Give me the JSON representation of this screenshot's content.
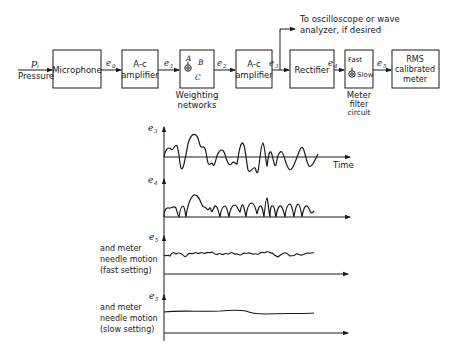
{
  "block_diagram": {
    "input": {
      "symbol": "p",
      "subscript": "i",
      "label": "Pressure"
    },
    "blocks": [
      {
        "id": "microphone",
        "label": [
          "Microphone"
        ]
      },
      {
        "id": "ac-amplifier-1",
        "label": [
          "A-c",
          "amplifier"
        ]
      },
      {
        "id": "weighting",
        "label": [
          "A",
          "B",
          "C"
        ],
        "caption": [
          "Weighting",
          "networks"
        ]
      },
      {
        "id": "ac-amplifier-2",
        "label": [
          "A-c",
          "amplifier"
        ]
      },
      {
        "id": "rectifier",
        "label": [
          "Rectifier"
        ]
      },
      {
        "id": "meter-filter",
        "label": [
          "Fast",
          "Slow"
        ],
        "caption": [
          "Meter",
          "filter",
          "circuit"
        ]
      },
      {
        "id": "rms-meter",
        "label": [
          "RMS",
          "calibrated",
          "meter"
        ]
      }
    ],
    "signals": [
      "e0",
      "e1",
      "e2",
      "e3",
      "e4",
      "e5"
    ],
    "signal_labels": {
      "e0": "e",
      "s0": "0",
      "e1": "e",
      "s1": "1",
      "e2": "e",
      "s2": "2",
      "e3": "e",
      "s3": "3",
      "e4": "e",
      "s4": "4",
      "e5": "e",
      "s5": "5"
    },
    "branch_note": [
      "To oscilloscope or wave",
      "analyzer, if desired"
    ]
  },
  "waveforms": [
    {
      "id": "e3",
      "symbol": "e",
      "sub": "3",
      "label": [],
      "x_label": "Time"
    },
    {
      "id": "e4",
      "symbol": "e",
      "sub": "4",
      "label": []
    },
    {
      "id": "e5-fast",
      "symbol": "e",
      "sub": "5",
      "label": [
        "and meter",
        "needle motion",
        "(fast setting)"
      ]
    },
    {
      "id": "e5-slow",
      "symbol": "e",
      "sub": "5",
      "label": [
        "and meter",
        "needle motion",
        "(slow setting)"
      ]
    }
  ]
}
